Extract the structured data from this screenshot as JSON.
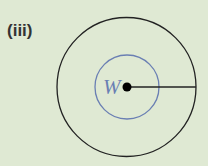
{
  "figure": {
    "label": "(iii)",
    "center_label": "W",
    "colors": {
      "background": "#dfe9d3",
      "outer_circle": "#222222",
      "inner_circle": "#6a7fb3",
      "label_W": "#6a7fb3",
      "dot": "#000000"
    }
  }
}
